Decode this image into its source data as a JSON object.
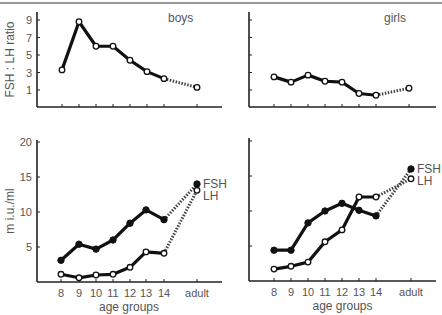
{
  "figure": {
    "top_rule": true,
    "panel_labels": {
      "boys": "boys",
      "girls": "girls"
    }
  },
  "chart_data": [
    {
      "type": "line",
      "panel": "top-left",
      "title": "boys",
      "xlabel": "",
      "ylabel": "FSH : LH ratio",
      "categories": [
        "8",
        "9",
        "10",
        "11",
        "12",
        "13",
        "14",
        "adult"
      ],
      "yticks": [
        1,
        3,
        5,
        7,
        9
      ],
      "ylim": [
        0,
        10
      ],
      "series": [
        {
          "name": "FSH:LH ratio",
          "marker": "open",
          "values": [
            3.3,
            8.8,
            6.0,
            6.0,
            4.4,
            3.1,
            2.3,
            1.3
          ],
          "dashed_last_segment": true
        }
      ]
    },
    {
      "type": "line",
      "panel": "top-right",
      "title": "girls",
      "xlabel": "",
      "ylabel": "",
      "categories": [
        "8",
        "9",
        "10",
        "11",
        "12",
        "13",
        "14",
        "adult"
      ],
      "yticks": [
        1,
        3,
        5,
        7,
        9
      ],
      "ylim": [
        0,
        10
      ],
      "series": [
        {
          "name": "FSH:LH ratio",
          "marker": "open",
          "values": [
            2.5,
            1.9,
            2.7,
            2.0,
            1.9,
            0.6,
            0.4,
            1.2
          ],
          "dashed_last_segment": true
        }
      ]
    },
    {
      "type": "line",
      "panel": "bottom-left",
      "title": "boys",
      "xlabel": "age groups",
      "ylabel": "m i.u./ml",
      "categories": [
        "8",
        "9",
        "10",
        "11",
        "12",
        "13",
        "14",
        "adult"
      ],
      "yticks": [
        5,
        10,
        15,
        20
      ],
      "ylim": [
        0,
        20
      ],
      "series": [
        {
          "name": "FSH",
          "marker": "filled",
          "values": [
            3.1,
            5.4,
            4.7,
            6.0,
            8.4,
            10.3,
            8.9,
            14.0
          ],
          "dashed_last_segment": true
        },
        {
          "name": "LH",
          "marker": "open",
          "values": [
            1.1,
            0.6,
            1.0,
            1.1,
            2.1,
            4.3,
            4.1,
            13.1
          ],
          "dashed_last_segment": true
        }
      ],
      "legend": [
        "FSH",
        "LH"
      ]
    },
    {
      "type": "line",
      "panel": "bottom-right",
      "title": "girls",
      "xlabel": "age groups",
      "ylabel": "",
      "categories": [
        "8",
        "9",
        "10",
        "11",
        "12",
        "13",
        "14",
        "adult"
      ],
      "yticks": [
        5,
        10,
        15,
        20
      ],
      "ylim": [
        0,
        20
      ],
      "series": [
        {
          "name": "FSH",
          "marker": "filled",
          "values": [
            4.4,
            4.4,
            8.3,
            10.0,
            11.1,
            10.1,
            9.3,
            16.0
          ],
          "dashed_last_segment": true
        },
        {
          "name": "LH",
          "marker": "open",
          "values": [
            1.7,
            2.1,
            2.7,
            5.6,
            7.3,
            12.0,
            12.0,
            14.6
          ],
          "dashed_last_segment": true
        }
      ],
      "legend": [
        "FSH",
        "LH"
      ]
    }
  ]
}
